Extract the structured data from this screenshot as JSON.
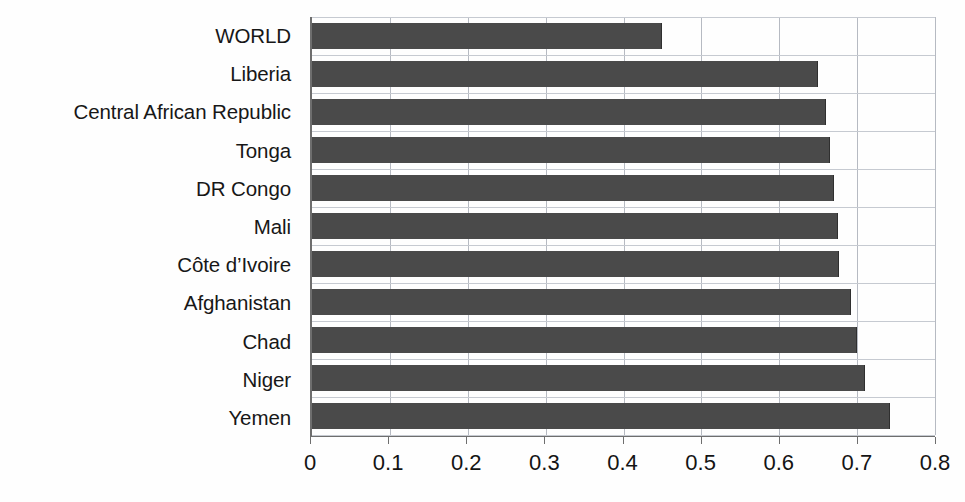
{
  "chart_data": {
    "type": "bar",
    "orientation": "horizontal",
    "title": "",
    "xlabel": "",
    "ylabel": "",
    "xlim": [
      0,
      0.8
    ],
    "xticks": [
      "0",
      "0.1",
      "0.2",
      "0.3",
      "0.4",
      "0.5",
      "0.6",
      "0.7",
      "0.8"
    ],
    "xtick_values": [
      0,
      0.1,
      0.2,
      0.3,
      0.4,
      0.5,
      0.6,
      0.7,
      0.8
    ],
    "grid": "vertical-and-horizontal",
    "legend": "none",
    "bar_color": "#4a4a4a",
    "categories": [
      "WORLD",
      "Liberia",
      "Central African Republic",
      "Tonga",
      "DR Congo",
      "Mali",
      "Côte d’Ivoire",
      "Afghanistan",
      "Chad",
      "Niger",
      "Yemen"
    ],
    "values": [
      0.45,
      0.65,
      0.66,
      0.665,
      0.67,
      0.675,
      0.677,
      0.692,
      0.7,
      0.71,
      0.742
    ]
  },
  "axis": {
    "tick_labels": [
      "0",
      "0.1",
      "0.2",
      "0.3",
      "0.4",
      "0.5",
      "0.6",
      "0.7",
      "0.8"
    ]
  },
  "colors": {
    "bar": "#4a4a4a",
    "gridline": "#b6bac2",
    "axis": "#6e6e6e",
    "text": "#171717"
  }
}
